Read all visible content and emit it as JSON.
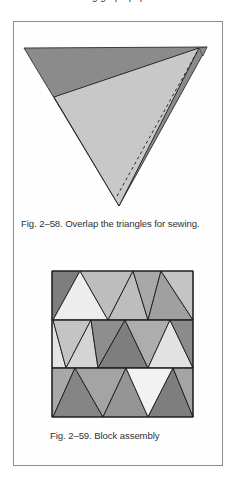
{
  "page": {
    "cut_off_text": "...ing graph paper..."
  },
  "figures": [
    {
      "id": "fig-2-58",
      "caption": "Fig. 2–58. Overlap the triangles for sewing.",
      "colors": {
        "dark": "#8b8b8b",
        "light": "#c8c8c8",
        "stroke": "#1a1a1a"
      }
    },
    {
      "id": "fig-2-59",
      "caption": "Fig. 2–59. Block assembly",
      "colors": {
        "very_light": "#ededed",
        "light": "#d4d4d4",
        "medium_light": "#bdbdbd",
        "medium": "#a8a8a8",
        "medium_dark": "#959595",
        "dark": "#7e7e7e",
        "stroke": "#1a1a1a"
      }
    }
  ]
}
